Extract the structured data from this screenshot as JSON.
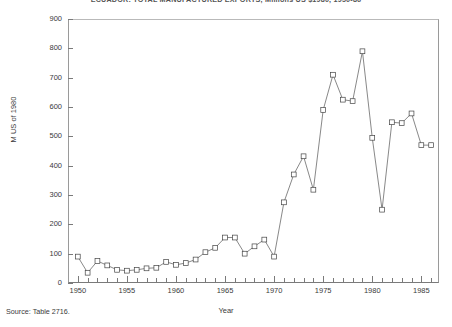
{
  "chart_data": {
    "type": "line",
    "title": "ECUADOR: TOTAL MANUFACTURED EXPORTS, Millions US $1980, 1950-86",
    "xlabel": "Year",
    "ylabel": "M US of 1980",
    "xlim": [
      1949,
      1986.8
    ],
    "ylim": [
      0,
      900
    ],
    "ytick_step": 100,
    "yticks": [
      0,
      100,
      200,
      300,
      400,
      500,
      600,
      700,
      800,
      900
    ],
    "ytick_labels": [
      "0",
      "100",
      "200",
      "300",
      "400",
      "500",
      "600",
      "700",
      "800",
      "900"
    ],
    "xticks": [
      1950,
      1955,
      1960,
      1965,
      1970,
      1975,
      1980,
      1985
    ],
    "xtick_labels": [
      "1950",
      "1955",
      "1960",
      "1965",
      "1970",
      "1975",
      "1980",
      "1985"
    ],
    "grid": false,
    "legend": "none",
    "marker": "open-square",
    "x": [
      1950,
      1951,
      1952,
      1953,
      1954,
      1955,
      1956,
      1957,
      1958,
      1959,
      1960,
      1961,
      1962,
      1963,
      1964,
      1965,
      1966,
      1967,
      1968,
      1969,
      1970,
      1971,
      1972,
      1973,
      1974,
      1975,
      1976,
      1977,
      1978,
      1979,
      1980,
      1981,
      1982,
      1983,
      1984,
      1985,
      1986
    ],
    "values": [
      90,
      35,
      75,
      60,
      45,
      42,
      45,
      50,
      52,
      72,
      62,
      68,
      80,
      105,
      120,
      155,
      155,
      100,
      125,
      148,
      90,
      275,
      370,
      432,
      318,
      590,
      710,
      625,
      620,
      790,
      495,
      250,
      548,
      545,
      578,
      470,
      470
    ],
    "source_note": "Source: Table 2716."
  },
  "footer": {
    "source": "Source: Table 2716."
  }
}
